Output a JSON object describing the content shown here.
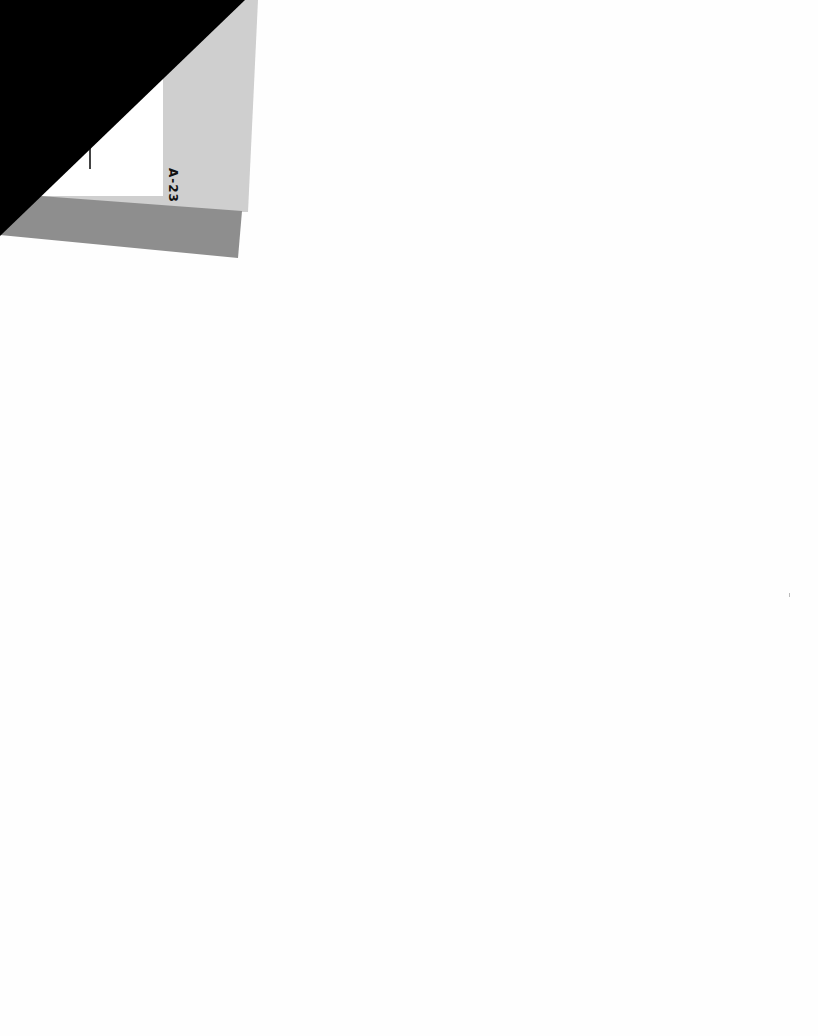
{
  "document": {
    "type": "scanned-page",
    "tab": {
      "label": "A-23",
      "colors": {
        "light_gray": "#cfcfcf",
        "dark_gray": "#8e8e8e",
        "panel": "#ffffff",
        "mask": "#000000"
      }
    },
    "background_color": "#fefefe",
    "bleed_through": {
      "top": "",
      "bottom": ""
    }
  }
}
